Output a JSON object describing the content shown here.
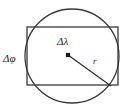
{
  "figure": {
    "name": "circle-inscribing-rectangle-diagram",
    "type": "geometric-diagram",
    "background_color": "#ffffff",
    "stroke_color": "#3a3a3a",
    "label_color": "#2b2b2b",
    "labels": {
      "delta_lambda": "Δλ",
      "delta_phi": "Δφ",
      "radius": "r"
    },
    "shapes": {
      "circle": {
        "name": "bounding-circle",
        "center_x": 72,
        "center_y": 56,
        "radius": 47,
        "stroke_width": 1.3,
        "fill": "none"
      },
      "rectangle": {
        "name": "grid-cell-rectangle",
        "x": 27,
        "y": 27,
        "width": 91,
        "height": 58,
        "stroke_width": 1.3,
        "fill": "none"
      },
      "center_point": {
        "name": "center-marker",
        "x": 68,
        "y": 55,
        "size": 4.2,
        "fill": "#1a1a1a"
      },
      "radius_line": {
        "name": "radius-segment",
        "x1": 68,
        "y1": 55,
        "x2": 111,
        "y2": 86,
        "stroke_width": 1.2
      }
    },
    "label_positions": {
      "delta_lambda": {
        "x": 57,
        "y": 45
      },
      "delta_phi": {
        "x": 3,
        "y": 62
      },
      "radius": {
        "x": 93,
        "y": 64
      }
    }
  }
}
